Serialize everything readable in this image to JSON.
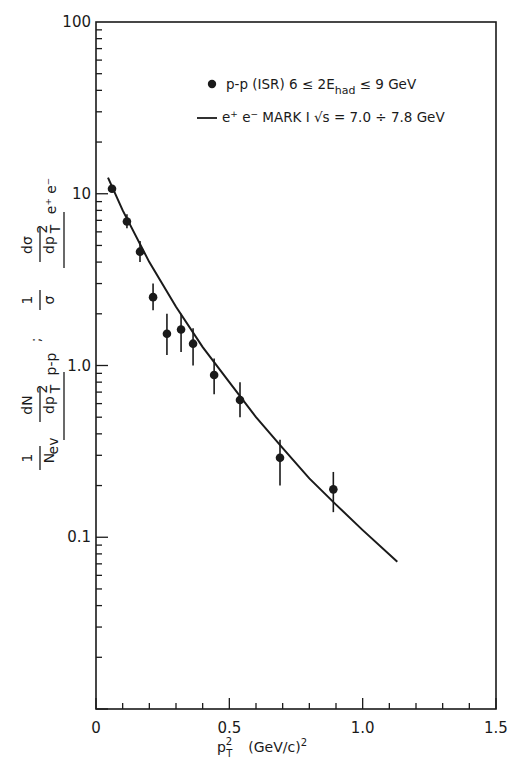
{
  "chart_data": {
    "type": "scatter",
    "title": "",
    "xlabel": "p_T^2   (GeV/c)^2",
    "xlabel_parts": {
      "main": "p",
      "sup": "2",
      "sub": "T",
      "unit": "(GeV/c)",
      "unit_sup": "2"
    },
    "ylabel": "1/N_ev dN/dp_T^2 |p-p ; 1/σ dσ/dp_T^2 |e+e-",
    "xlim": [
      0,
      1.5
    ],
    "ylim": [
      0.01,
      100
    ],
    "yscale": "log",
    "grid": false,
    "x_ticks": [
      {
        "value": 0,
        "label": "0"
      },
      {
        "value": 0.5,
        "label": "0.5"
      },
      {
        "value": 1.0,
        "label": "1.0"
      },
      {
        "value": 1.5,
        "label": "1.5"
      }
    ],
    "y_ticks": [
      {
        "value": 100,
        "label": "100"
      },
      {
        "value": 10,
        "label": "10"
      },
      {
        "value": 1.0,
        "label": "1.0"
      },
      {
        "value": 0.1,
        "label": "0.1"
      }
    ],
    "legend_position": "upper right",
    "legend": [
      {
        "marker": "dot",
        "text": "p-p (ISR)   6 ≤ 2E",
        "sub": "had",
        "text2": " ≤ 9 GeV"
      },
      {
        "marker": "line",
        "text": "e",
        "sup1": "+",
        "text_b": " e",
        "sup2": "−",
        "text2": "  MARK I  √s = 7.0 ÷ 7.8  GeV"
      }
    ],
    "series": [
      {
        "name": "p-p (ISR) 6 ≤ 2E_had ≤ 9 GeV",
        "type": "scatter_errorbar",
        "points": [
          {
            "x": 0.06,
            "y": 10.7,
            "ylo": 10.7,
            "yhi": 10.7
          },
          {
            "x": 0.116,
            "y": 6.9,
            "ylo": 6.3,
            "yhi": 7.6
          },
          {
            "x": 0.165,
            "y": 4.6,
            "ylo": 4.0,
            "yhi": 5.3
          },
          {
            "x": 0.214,
            "y": 2.5,
            "ylo": 2.1,
            "yhi": 3.0
          },
          {
            "x": 0.266,
            "y": 1.53,
            "ylo": 1.15,
            "yhi": 2.0
          },
          {
            "x": 0.319,
            "y": 1.62,
            "ylo": 1.2,
            "yhi": 2.0
          },
          {
            "x": 0.364,
            "y": 1.34,
            "ylo": 1.0,
            "yhi": 1.65
          },
          {
            "x": 0.443,
            "y": 0.88,
            "ylo": 0.68,
            "yhi": 1.1
          },
          {
            "x": 0.54,
            "y": 0.63,
            "ylo": 0.5,
            "yhi": 0.8
          },
          {
            "x": 0.69,
            "y": 0.29,
            "ylo": 0.2,
            "yhi": 0.37
          },
          {
            "x": 0.89,
            "y": 0.19,
            "ylo": 0.14,
            "yhi": 0.24
          }
        ]
      },
      {
        "name": "e+e- MARK I √s = 7.0 ÷ 7.8 GeV",
        "type": "line",
        "points": [
          {
            "x": 0.045,
            "y": 12.4
          },
          {
            "x": 0.1,
            "y": 8.0
          },
          {
            "x": 0.2,
            "y": 4.0
          },
          {
            "x": 0.3,
            "y": 2.2
          },
          {
            "x": 0.4,
            "y": 1.28
          },
          {
            "x": 0.5,
            "y": 0.8
          },
          {
            "x": 0.6,
            "y": 0.5
          },
          {
            "x": 0.7,
            "y": 0.33
          },
          {
            "x": 0.8,
            "y": 0.22
          },
          {
            "x": 0.9,
            "y": 0.155
          },
          {
            "x": 1.0,
            "y": 0.11
          },
          {
            "x": 1.13,
            "y": 0.072
          }
        ]
      }
    ],
    "colors": {
      "ink": "#1a1a1a",
      "background": "#ffffff"
    }
  }
}
